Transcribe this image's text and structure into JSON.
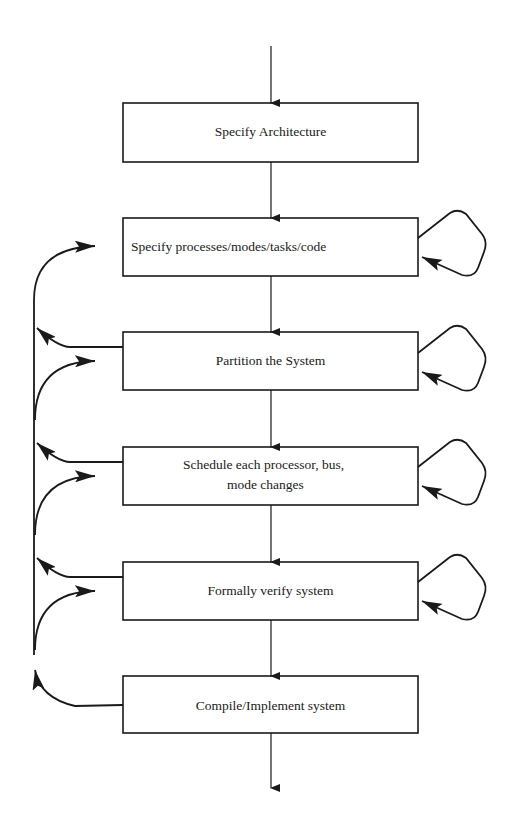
{
  "diagram": {
    "type": "flowchart",
    "steps": [
      {
        "label": "Specify Architecture"
      },
      {
        "label": "Specify processes/modes/tasks/code"
      },
      {
        "label": "Partition the System"
      },
      {
        "label": "Schedule each processor, bus,",
        "label2": "mode changes"
      },
      {
        "label": "Formally verify system"
      },
      {
        "label": "Compile/Implement system"
      }
    ],
    "colors": {
      "line": "#1a1a1a",
      "background": "#ffffff"
    }
  }
}
